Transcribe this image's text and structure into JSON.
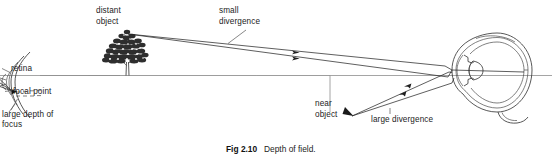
{
  "figure": {
    "caption_label": "Fig 2.10",
    "caption_text": "Depth of field.",
    "ink_color": "#2a2a2a",
    "axis_color": "#8e8e8e"
  },
  "labels": {
    "distant_object_line1": "distant",
    "distant_object_line2": "object",
    "small_divergence_line1": "small",
    "small_divergence_line2": "divergence",
    "near_object_line1": "near",
    "near_object_line2": "object",
    "large_divergence": "large divergence",
    "retina": "retina",
    "focal_point": "focal point",
    "large_depth_line1": "large depth of",
    "large_depth_line2": "focus"
  },
  "elements": {
    "left_eye_name": "partial eye cross-section (left, cropped)",
    "right_eye_name": "eye cross-section (right)",
    "tree_name": "distant object tree",
    "ground_line_name": "ground line",
    "optical_axis_name": "optical axis"
  }
}
